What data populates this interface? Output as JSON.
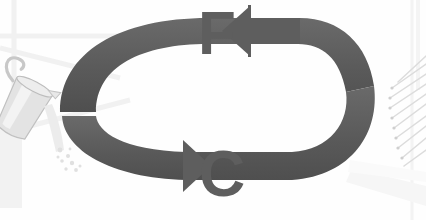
{
  "diagram": {
    "type": "two-way-cycle-diagram",
    "background_color": "#fefefe",
    "arrow_color": "#5a5a5a",
    "arrow_color_light": "#6e6e6e",
    "letter_color": "#5e5e5e",
    "watermark_color": "#f0f0f0",
    "labels": {
      "top": "F",
      "bottom": "C"
    },
    "arrows": [
      {
        "name": "top-arrow",
        "direction": "left",
        "points_to": "F",
        "description": "Upper curved gray arrow sweeping right-to-left ending in a left-pointing arrowhead beside the letter F"
      },
      {
        "name": "bottom-arrow",
        "direction": "right",
        "points_to": "C",
        "description": "Lower curved gray arrow sweeping left-to-right ending in a right-pointing arrowhead beside the letter C"
      }
    ],
    "objects": [
      {
        "name": "pitcher",
        "position": "left",
        "description": "Tilted metal pitcher pouring a stream with droplets onto the arrow band"
      },
      {
        "name": "stick-bundle",
        "position": "right",
        "description": "Fan of thin diagonal sticks or matches radiating from the right side of the ring"
      }
    ]
  }
}
